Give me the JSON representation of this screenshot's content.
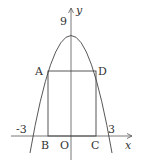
{
  "diagram": {
    "type": "parabola-inscribed-rectangle",
    "axes": {
      "x_label": "x",
      "y_label": "y",
      "origin_label": "O"
    },
    "parabola": {
      "vertex_label": "9",
      "root_left_label": "-3",
      "root_right_label": "3"
    },
    "rectangle": {
      "points": {
        "A": "A",
        "B": "B",
        "C": "C",
        "D": "D"
      }
    },
    "colors": {
      "stroke": "#444444",
      "background": "#ffffff"
    }
  }
}
